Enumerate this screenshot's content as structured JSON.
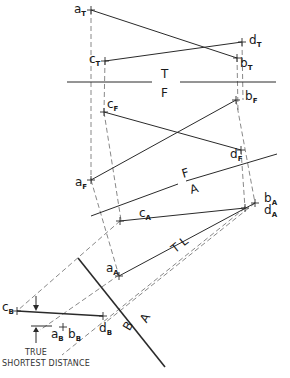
{
  "figure": {
    "caption_line1": "TRUE",
    "caption_line2": "SHORTEST DISTANCE"
  },
  "planes": {
    "tf_top": "T",
    "tf_bottom": "F",
    "fa_top": "F",
    "fa_bottom": "A",
    "ab_top": "A",
    "ab_bottom": "B"
  },
  "true_length_label": "T L",
  "points": {
    "aT": {
      "main": "a",
      "sub": "T"
    },
    "bT": {
      "main": "b",
      "sub": "T"
    },
    "cT": {
      "main": "c",
      "sub": "T"
    },
    "dT": {
      "main": "d",
      "sub": "T"
    },
    "aF": {
      "main": "a",
      "sub": "F"
    },
    "bF": {
      "main": "b",
      "sub": "F"
    },
    "cF": {
      "main": "c",
      "sub": "F"
    },
    "dF": {
      "main": "d",
      "sub": "F"
    },
    "aA": {
      "main": "a",
      "sub": "A"
    },
    "bA": {
      "main": "b",
      "sub": "A"
    },
    "cA": {
      "main": "c",
      "sub": "A"
    },
    "dA": {
      "main": "d",
      "sub": "A"
    },
    "aB": {
      "main": "a",
      "sub": "B"
    },
    "bB": {
      "main": "b",
      "sub": "B"
    },
    "cB": {
      "main": "c",
      "sub": "B"
    },
    "dB": {
      "main": "d",
      "sub": "B"
    }
  }
}
